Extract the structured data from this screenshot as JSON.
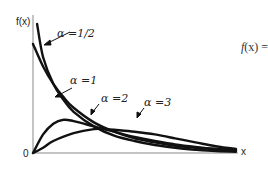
{
  "chart_data": {
    "type": "line",
    "title": "",
    "xlabel": "x",
    "ylabel": "f(x)",
    "origin_label": "0",
    "formula_fragment": "f(x) =",
    "grid": false,
    "legend_position": "inline annotations with arrows",
    "xlim": [
      0,
      1
    ],
    "ylim": [
      0,
      1
    ],
    "series": [
      {
        "name": "α =1/2",
        "param": "alpha",
        "value": 0.5,
        "points": [
          [
            0.02,
            0.97
          ],
          [
            0.05,
            0.72
          ],
          [
            0.1,
            0.52
          ],
          [
            0.15,
            0.4
          ],
          [
            0.2,
            0.31
          ],
          [
            0.3,
            0.2
          ],
          [
            0.4,
            0.13
          ],
          [
            0.5,
            0.09
          ],
          [
            0.6,
            0.06
          ],
          [
            0.7,
            0.04
          ],
          [
            0.8,
            0.025
          ],
          [
            0.9,
            0.015
          ],
          [
            1.0,
            0.01
          ]
        ]
      },
      {
        "name": "α =1",
        "param": "alpha",
        "value": 1,
        "points": [
          [
            0.0,
            0.82
          ],
          [
            0.05,
            0.65
          ],
          [
            0.1,
            0.52
          ],
          [
            0.15,
            0.42
          ],
          [
            0.2,
            0.34
          ],
          [
            0.3,
            0.23
          ],
          [
            0.4,
            0.16
          ],
          [
            0.5,
            0.11
          ],
          [
            0.6,
            0.08
          ],
          [
            0.7,
            0.055
          ],
          [
            0.8,
            0.04
          ],
          [
            0.9,
            0.03
          ],
          [
            1.0,
            0.02
          ]
        ]
      },
      {
        "name": "α =2",
        "param": "alpha",
        "value": 2,
        "points": [
          [
            0.0,
            0.0
          ],
          [
            0.05,
            0.14
          ],
          [
            0.1,
            0.22
          ],
          [
            0.15,
            0.25
          ],
          [
            0.2,
            0.24
          ],
          [
            0.3,
            0.2
          ],
          [
            0.4,
            0.16
          ],
          [
            0.5,
            0.12
          ],
          [
            0.6,
            0.09
          ],
          [
            0.7,
            0.065
          ],
          [
            0.8,
            0.045
          ],
          [
            0.9,
            0.03
          ],
          [
            1.0,
            0.02
          ]
        ]
      },
      {
        "name": "α =3",
        "param": "alpha",
        "value": 3,
        "points": [
          [
            0.0,
            0.0
          ],
          [
            0.05,
            0.04
          ],
          [
            0.1,
            0.09
          ],
          [
            0.2,
            0.15
          ],
          [
            0.3,
            0.18
          ],
          [
            0.35,
            0.18
          ],
          [
            0.4,
            0.175
          ],
          [
            0.5,
            0.16
          ],
          [
            0.6,
            0.14
          ],
          [
            0.7,
            0.11
          ],
          [
            0.8,
            0.08
          ],
          [
            0.9,
            0.05
          ],
          [
            1.0,
            0.03
          ]
        ]
      }
    ],
    "annotations": [
      {
        "text": "α =1/2",
        "target_series": "α =1/2"
      },
      {
        "text": "α =1",
        "target_series": "α =1"
      },
      {
        "text": "α =2",
        "target_series": "α =2"
      },
      {
        "text": "α =3",
        "target_series": "α =3"
      }
    ]
  },
  "labels": {
    "ylabel": "f(x)",
    "xlabel": "x",
    "origin": "0",
    "a_half": "α =1/2",
    "a_one": "α =1",
    "a_two": "α =2",
    "a_three": "α =3",
    "formula_f": "f",
    "formula_rest": "(x) ="
  },
  "style": {
    "curve_color": "#111111",
    "axis_color": "#888888"
  }
}
